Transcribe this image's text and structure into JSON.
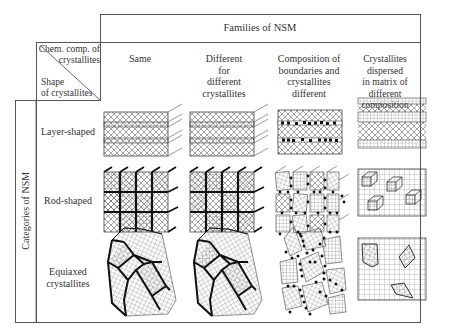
{
  "title": "Families of NSM",
  "corner": {
    "top_label": "Chem. comp. of crystallites",
    "top_line1": "Chem. comp. of",
    "top_line2": "crystallites",
    "bottom_label": "Shape of crystallites",
    "bottom_line1": "Shape",
    "bottom_line2": "of crystallites"
  },
  "side_label": "Categories of NSM",
  "columns": [
    {
      "id": "same",
      "label": "Same",
      "lines": [
        "Same"
      ]
    },
    {
      "id": "different",
      "label": "Different for different crystallites",
      "lines": [
        "Different",
        "for",
        "different",
        "crystallites"
      ]
    },
    {
      "id": "composition",
      "label": "Composition of boundaries and crystallites different",
      "lines": [
        "Composition of",
        "boundaries and",
        "crystallites",
        "different"
      ]
    },
    {
      "id": "dispersed",
      "label": "Crystallites dispersed in matrix of different composition",
      "lines": [
        "Crystallites dispersed",
        "in matrix of",
        "different composition"
      ]
    }
  ],
  "rows": [
    {
      "id": "layer",
      "label": "Layer-shaped",
      "lines": [
        "Layer-shaped"
      ]
    },
    {
      "id": "rod",
      "label": "Rod-shaped",
      "lines": [
        "Rod-shaped"
      ]
    },
    {
      "id": "equiaxed",
      "label": "Equiaxed crystallites",
      "lines": [
        "Equiaxed",
        "crystallites"
      ]
    }
  ],
  "colors": {
    "line": "#555555",
    "boundary": "#111111",
    "hatch": "#666666",
    "dot": "#111111"
  }
}
